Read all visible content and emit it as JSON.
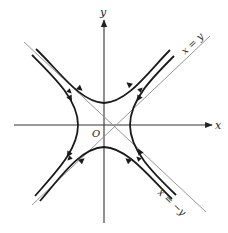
{
  "diagram": {
    "type": "phase-portrait-saddle",
    "axes": {
      "x_label": "x",
      "y_label": "y",
      "origin_label": "O"
    },
    "asymptotes": [
      {
        "name": "x=y",
        "label": "x = y"
      },
      {
        "name": "x=-y",
        "label": "x = −y"
      }
    ],
    "trajectories": [
      {
        "name": "upper-hyperbola",
        "flow": "inward along x=-y, outward along x=y"
      },
      {
        "name": "lower-hyperbola",
        "flow": "inward along x=-y, outward along x=y"
      },
      {
        "name": "left-hyperbola",
        "flow": "inward along x=-y, outward along x=y"
      },
      {
        "name": "right-hyperbola",
        "flow": "inward along x=-y, outward along x=y"
      }
    ],
    "colors": {
      "curve": "#1a1a1a",
      "asymptote": "#8a8a8a",
      "axis": "#333333",
      "background": "#ffffff"
    }
  }
}
